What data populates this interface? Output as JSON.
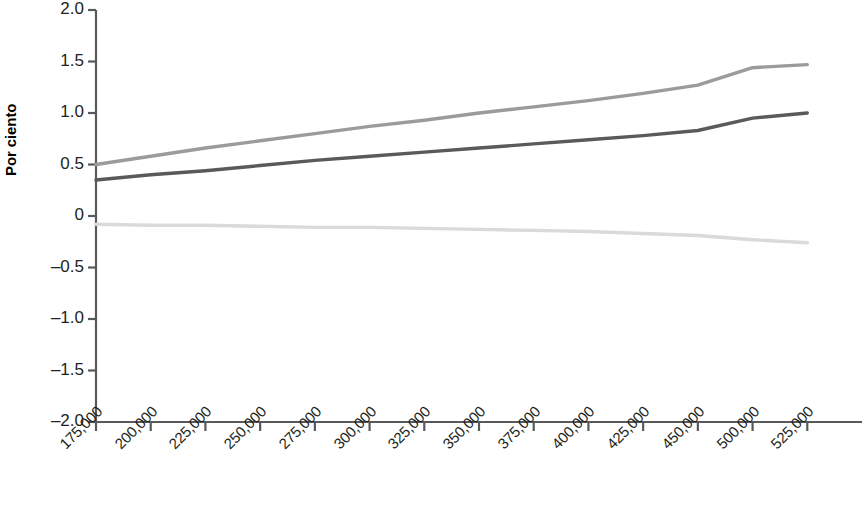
{
  "chart_data": {
    "type": "line",
    "title": "",
    "xlabel": "",
    "ylabel": "Por ciento",
    "ylim": [
      -2.0,
      2.0
    ],
    "grid": false,
    "legend": "none",
    "y_ticks": [
      "2.0",
      "1.5",
      "1.0",
      "0.5",
      "0",
      "–0.5",
      "–1.0",
      "–1.5",
      "–2.0"
    ],
    "y_tick_values": [
      2.0,
      1.5,
      1.0,
      0.5,
      0,
      -0.5,
      -1.0,
      -1.5,
      -2.0
    ],
    "categories": [
      "175,000",
      "200,000",
      "225,000",
      "250,000",
      "275,000",
      "300,000",
      "325,000",
      "350,000",
      "375,000",
      "400,000",
      "425,000",
      "450,000",
      "500,000",
      "525,000"
    ],
    "series": [
      {
        "name": "upper-line",
        "color": "#9b9b9b",
        "values": [
          0.5,
          0.58,
          0.66,
          0.73,
          0.8,
          0.87,
          0.93,
          1.0,
          1.06,
          1.12,
          1.19,
          1.27,
          1.44,
          1.47
        ]
      },
      {
        "name": "middle-line",
        "color": "#5a5a5a",
        "values": [
          0.35,
          0.4,
          0.44,
          0.49,
          0.54,
          0.58,
          0.62,
          0.66,
          0.7,
          0.74,
          0.78,
          0.83,
          0.95,
          1.0
        ]
      },
      {
        "name": "lower-line",
        "color": "#dadada",
        "values": [
          -0.08,
          -0.09,
          -0.09,
          -0.1,
          -0.11,
          -0.11,
          -0.12,
          -0.13,
          -0.14,
          -0.15,
          -0.17,
          -0.19,
          -0.23,
          -0.26
        ]
      }
    ]
  },
  "axes": {
    "y_title": "Por ciento"
  }
}
